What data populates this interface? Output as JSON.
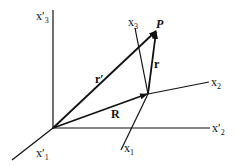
{
  "diagram": {
    "labels": {
      "x3_prime": "x′",
      "x3_prime_sub": "3",
      "x3": "x",
      "x3_sub": "3",
      "P": "P",
      "r_prime": "r′",
      "r": "r",
      "x2": "x",
      "x2_sub": "2",
      "R": "R",
      "x2_prime": "x′",
      "x2_prime_sub": "2",
      "x1_prime": "x′",
      "x1_prime_sub": "1",
      "x1": "x",
      "x1_sub": "1"
    },
    "colors": {
      "line": "#111111",
      "background": "#ffffff"
    }
  }
}
